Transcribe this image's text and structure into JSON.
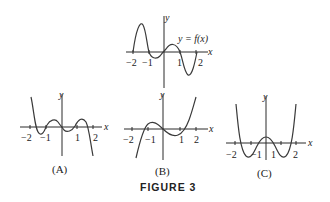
{
  "figure": {
    "caption": "FIGURE 3",
    "main_graph": {
      "label": "y = f(x)",
      "x_axis_label": "x",
      "y_axis_label": "y",
      "tick_labels": [
        "−2",
        "−1",
        "1",
        "2"
      ]
    },
    "options": [
      {
        "id": "A",
        "label": "(A)",
        "x_axis_label": "x",
        "y_axis_label": "y",
        "tick_labels": [
          "−2",
          "−1",
          "1",
          "2"
        ]
      },
      {
        "id": "B",
        "label": "(B)",
        "x_axis_label": "x",
        "y_axis_label": "y",
        "tick_labels": [
          "−2",
          "−1",
          "1",
          "2"
        ]
      },
      {
        "id": "C",
        "label": "(C)",
        "x_axis_label": "x",
        "y_axis_label": "y",
        "tick_labels": [
          "−2",
          "−1",
          "1",
          "2"
        ]
      }
    ]
  }
}
